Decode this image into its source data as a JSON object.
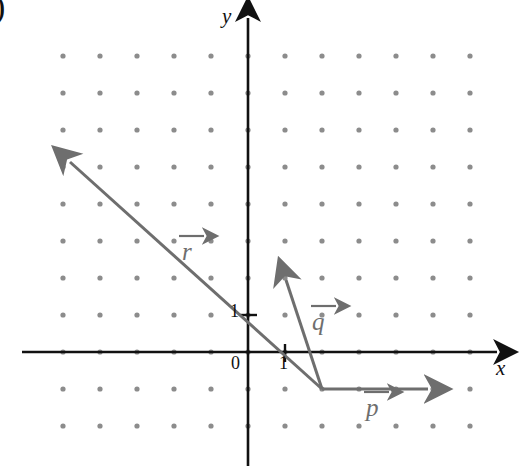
{
  "figure": {
    "corner_label": ")",
    "background_color": "#ffffff",
    "axis_color": "#111111",
    "vector_color": "#6e6e6e",
    "dot_color": "#8c8c8c"
  },
  "axes": {
    "x_label": "x",
    "y_label": "y",
    "origin_label": "0",
    "x_tick_label": "1",
    "y_tick_label": "1"
  },
  "chart_data": {
    "type": "scatter",
    "title": "",
    "xlabel": "x",
    "ylabel": "y",
    "grid": true,
    "legend": "none",
    "origin_px": [
      248,
      352
    ],
    "unit_px": 37,
    "xlim": [
      -5,
      6
    ],
    "ylim": [
      -2,
      8
    ],
    "lattice_dots": {
      "x_values": [
        -5,
        -4,
        -3,
        -2,
        -1,
        0,
        1,
        2,
        3,
        4,
        5,
        6
      ],
      "y_values": [
        -2,
        -1,
        0,
        1,
        2,
        3,
        4,
        5,
        6,
        7,
        8
      ]
    },
    "tick_marks": {
      "x": [
        1
      ],
      "y": [
        1
      ]
    },
    "vectors": [
      {
        "name": "p",
        "label": "p",
        "tail": [
          2,
          -1
        ],
        "head": [
          5,
          -1
        ],
        "components": [
          3,
          0
        ],
        "label_pos": [
          3.45,
          -1.45
        ]
      },
      {
        "name": "q",
        "label": "q",
        "tail": [
          2,
          -1
        ],
        "head": [
          1,
          2
        ],
        "components": [
          -1,
          3
        ],
        "label_pos": [
          2.0,
          0.8
        ]
      },
      {
        "name": "r",
        "label": "r",
        "tail": [
          2,
          -1
        ],
        "head": [
          -5,
          5
        ],
        "components": [
          -7,
          6
        ],
        "label_pos": [
          -1.45,
          2.7
        ]
      }
    ]
  }
}
